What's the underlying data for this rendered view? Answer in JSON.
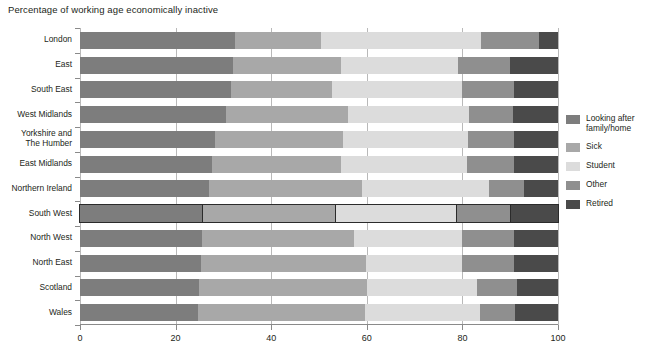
{
  "title": "Percentage of working age economically inactive",
  "colors": {
    "looking_after": "#7d7d7d",
    "sick": "#a8a8a8",
    "student": "#dcdcdc",
    "other": "#8f8f8f",
    "retired": "#4a4a4a",
    "gridline": "#b9b9b9",
    "axis": "#8a8a8a",
    "text": "#231f20",
    "highlight_outline": "#2b2b2b"
  },
  "legend": {
    "position": "right",
    "items": [
      {
        "label": "Looking after\nfamily/home",
        "key": "looking_after",
        "swatch": "#7d7d7d"
      },
      {
        "label": "Sick",
        "key": "sick",
        "swatch": "#a8a8a8"
      },
      {
        "label": "Student",
        "key": "student",
        "swatch": "#dcdcdc"
      },
      {
        "label": "Other",
        "key": "other",
        "swatch": "#8f8f8f"
      },
      {
        "label": "Retired",
        "key": "retired",
        "swatch": "#4a4a4a"
      }
    ]
  },
  "chart_data": {
    "type": "bar",
    "orientation": "horizontal",
    "stacked": true,
    "normalized": true,
    "title": "Percentage of working age economically inactive",
    "xlabel": "",
    "ylabel": "",
    "xlim": [
      0,
      100
    ],
    "xticks": [
      0,
      20,
      40,
      60,
      80,
      100
    ],
    "xtick_labels": [
      "0",
      "20",
      "40",
      "60",
      "80",
      "100"
    ],
    "grid": true,
    "grid_axis": "x",
    "categories": [
      "London",
      "East",
      "South East",
      "West Midlands",
      "Yorkshire and\nThe Humber",
      "East Midlands",
      "Northern Ireland",
      "South West",
      "North West",
      "North East",
      "Scotland",
      "Wales"
    ],
    "highlighted_category": "South West",
    "series": [
      {
        "name": "Looking after family/home",
        "color": "#7d7d7d",
        "values": [
          32.4,
          32.0,
          31.6,
          30.6,
          28.2,
          27.6,
          27.0,
          25.7,
          25.5,
          25.3,
          24.9,
          24.7
        ]
      },
      {
        "name": "Sick",
        "color": "#a8a8a8",
        "values": [
          18.0,
          22.7,
          21.2,
          25.5,
          26.8,
          27.0,
          32.0,
          27.9,
          31.8,
          34.5,
          35.1,
          35.0
        ]
      },
      {
        "name": "Student",
        "color": "#dcdcdc",
        "values": [
          33.6,
          24.3,
          27.2,
          25.3,
          26.2,
          26.4,
          26.6,
          25.4,
          22.7,
          20.2,
          23.0,
          23.9
        ]
      },
      {
        "name": "Other",
        "color": "#8f8f8f",
        "values": [
          12.0,
          11.0,
          10.7,
          9.2,
          9.5,
          9.7,
          7.3,
          11.0,
          10.9,
          10.7,
          8.4,
          7.4
        ]
      },
      {
        "name": "Retired",
        "color": "#4a4a4a",
        "values": [
          4.0,
          10.0,
          9.3,
          9.4,
          9.3,
          9.3,
          7.1,
          10.0,
          9.1,
          9.3,
          8.6,
          9.0
        ]
      }
    ]
  }
}
